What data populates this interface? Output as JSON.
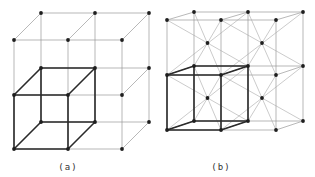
{
  "panels": [
    {
      "id": "a",
      "caption": "(a)",
      "caption_pos": [
        68,
        162
      ],
      "type": "simple-cubic-lattice",
      "front_x": [
        14,
        68,
        122
      ],
      "front_y": [
        40,
        95,
        149
      ],
      "depth_offset": [
        27,
        -27
      ],
      "highlight_cell": [
        0,
        1
      ],
      "body_centered": false
    },
    {
      "id": "b",
      "caption": "(b)",
      "caption_pos": [
        221,
        162
      ],
      "type": "body-centered-cubic-lattice",
      "front_x": [
        167,
        221,
        276
      ],
      "front_y": [
        20,
        75,
        130
      ],
      "depth_offset": [
        27,
        -8
      ],
      "highlight_cell": [
        0,
        1
      ],
      "body_centered": true
    }
  ],
  "colors": {
    "thin_line": "#9a9a9a",
    "thick_line": "#2a2a2a",
    "node": "#1e1e1e",
    "background": "#ffffff"
  }
}
